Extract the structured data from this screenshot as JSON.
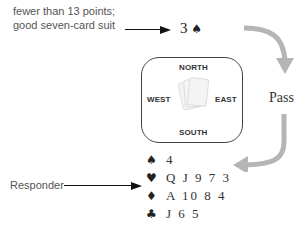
{
  "opener_note": {
    "line1": "fewer than 13 points;",
    "line2": "good seven-card suit"
  },
  "opening_bid": {
    "level": "3",
    "suit_symbol": "♠"
  },
  "table": {
    "north": "NORTH",
    "south": "SOUTH",
    "east": "EAST",
    "west": "WEST"
  },
  "east_call": "Pass",
  "responder_label": "Responder",
  "responder_hand": [
    {
      "suit": "spades",
      "symbol": "♠",
      "cards": "4"
    },
    {
      "suit": "hearts",
      "symbol": "♥",
      "cards": "Q J 9 7 3"
    },
    {
      "suit": "diamonds",
      "symbol": "♦",
      "cards": "A 10 8 4"
    },
    {
      "suit": "clubs",
      "symbol": "♣",
      "cards": "J 6 5"
    }
  ],
  "colors": {
    "flow_arrow": "#b5b5b5",
    "text": "#222222",
    "note_text": "#555555"
  }
}
